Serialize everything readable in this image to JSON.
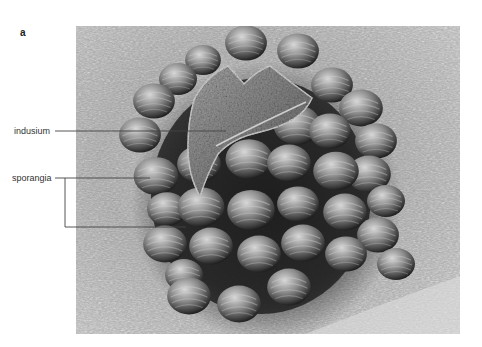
{
  "figure": {
    "panel_letter": "a",
    "image_description": "Scanning electron micrograph of a fern sorus on a leaf surface",
    "labels": [
      {
        "id": "indusium",
        "text": "indusium"
      },
      {
        "id": "sporangia",
        "text": "sporangia"
      }
    ],
    "colors": {
      "background": "#ffffff",
      "label_text": "#333333",
      "leader_line": "#444444"
    }
  }
}
